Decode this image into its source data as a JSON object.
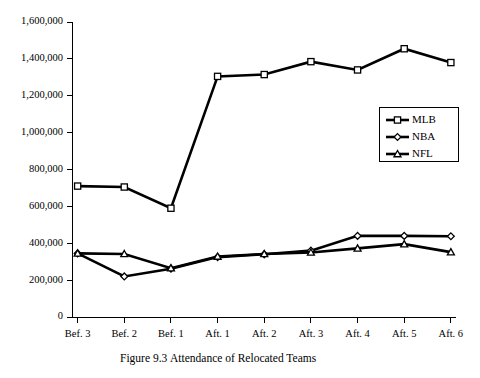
{
  "figure": {
    "caption_label": "Figure 9.3",
    "caption_title": "Attendance of Relocated Teams"
  },
  "legend": {
    "position": "upper-right-inside",
    "entries": [
      {
        "name": "MLB",
        "marker": "open-square"
      },
      {
        "name": "NBA",
        "marker": "open-diamond"
      },
      {
        "name": "NFL",
        "marker": "open-triangle"
      }
    ]
  },
  "chart_data": {
    "type": "line",
    "title": "Attendance of Relocated Teams",
    "xlabel": "",
    "ylabel": "",
    "grid": false,
    "ylim": [
      0,
      1600000
    ],
    "ytick_step": 200000,
    "ytick_labels": [
      "0",
      "200,000",
      "400,000",
      "600,000",
      "800,000",
      "1,000,000",
      "1,200,000",
      "1,400,000",
      "1,600,000"
    ],
    "ytick_values": [
      0,
      200000,
      400000,
      600000,
      800000,
      1000000,
      1200000,
      1400000,
      1600000
    ],
    "categories": [
      "Bef. 3",
      "Bef. 2",
      "Bef. 1",
      "Aft. 1",
      "Aft. 2",
      "Aft. 3",
      "Aft. 4",
      "Aft. 5",
      "Aft. 6"
    ],
    "series": [
      {
        "name": "MLB",
        "marker": "open-square",
        "values": [
          710000,
          705000,
          590000,
          1305000,
          1315000,
          1385000,
          1340000,
          1455000,
          1380000
        ]
      },
      {
        "name": "NBA",
        "marker": "open-diamond",
        "values": [
          345000,
          220000,
          262000,
          325000,
          340000,
          360000,
          440000,
          440000,
          438000
        ]
      },
      {
        "name": "NFL",
        "marker": "open-triangle",
        "values": [
          345000,
          342000,
          265000,
          328000,
          342000,
          350000,
          372000,
          395000,
          352000
        ]
      }
    ]
  }
}
